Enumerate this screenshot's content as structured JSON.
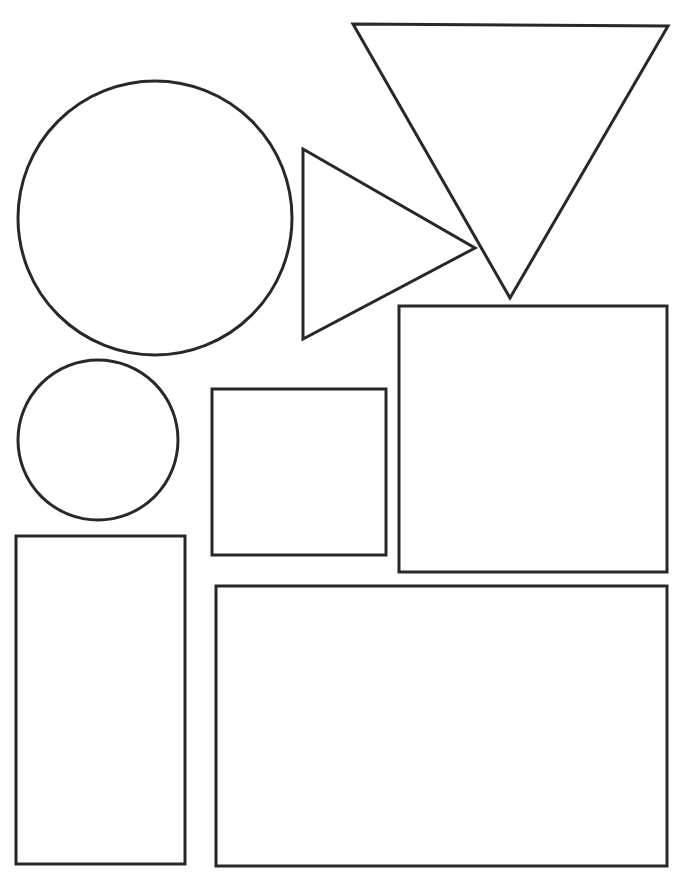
{
  "worksheet": {
    "background": "#ffffff",
    "stroke_color": "#2b2727",
    "stroke_width": 3,
    "shapes": [
      {
        "type": "circle",
        "name": "large-circle",
        "cx": 155,
        "cy": 218,
        "r": 137
      },
      {
        "type": "circle",
        "name": "small-circle",
        "cx": 98,
        "cy": 440,
        "r": 80
      },
      {
        "type": "triangle",
        "name": "right-pointing-triangle",
        "points": "303,149 475,248 303,339"
      },
      {
        "type": "triangle",
        "name": "inverted-triangle",
        "points": "353,24 668,26 510,298"
      },
      {
        "type": "rect",
        "name": "square",
        "x": 212,
        "y": 389,
        "w": 174,
        "h": 166
      },
      {
        "type": "rect",
        "name": "large-square",
        "x": 399,
        "y": 306,
        "w": 268,
        "h": 266
      },
      {
        "type": "rect",
        "name": "tall-rectangle",
        "x": 16,
        "y": 536,
        "w": 169,
        "h": 328
      },
      {
        "type": "rect",
        "name": "wide-rectangle",
        "x": 216,
        "y": 586,
        "w": 451,
        "h": 280
      }
    ]
  }
}
